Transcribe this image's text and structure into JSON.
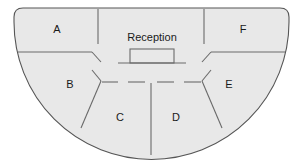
{
  "diagram": {
    "type": "floor-plan",
    "shape": "semicircle",
    "title": "",
    "colors": {
      "fill": "#e8e8e8",
      "stroke": "#6a6a6a",
      "outline": "#555555",
      "text": "#1a1a1a",
      "background": "#ffffff"
    },
    "reception": {
      "label": "Reception",
      "desk_shape": "rectangle-with-counter"
    },
    "rooms": [
      {
        "id": "A",
        "label": "A",
        "x": 57,
        "y": 30,
        "position": "outer-upper-left"
      },
      {
        "id": "B",
        "label": "B",
        "x": 70,
        "y": 85,
        "position": "outer-lower-left"
      },
      {
        "id": "C",
        "label": "C",
        "x": 120,
        "y": 118,
        "position": "inner-lower-left"
      },
      {
        "id": "D",
        "label": "D",
        "x": 176,
        "y": 118,
        "position": "inner-lower-right"
      },
      {
        "id": "E",
        "label": "E",
        "x": 229,
        "y": 85,
        "position": "outer-lower-right"
      },
      {
        "id": "F",
        "label": "F",
        "x": 243,
        "y": 30,
        "position": "outer-upper-right"
      }
    ],
    "doorways": [
      {
        "between": [
          "A",
          "B"
        ],
        "note": "gap in dividing wall"
      },
      {
        "between": [
          "E",
          "F"
        ],
        "note": "gap in dividing wall"
      },
      {
        "between": [
          "B",
          "C"
        ],
        "note": "gap in dividing wall"
      },
      {
        "between": [
          "C",
          "D"
        ],
        "note": "gap in dividing wall"
      },
      {
        "between": [
          "D",
          "E"
        ],
        "note": "gap in dividing wall"
      }
    ]
  }
}
